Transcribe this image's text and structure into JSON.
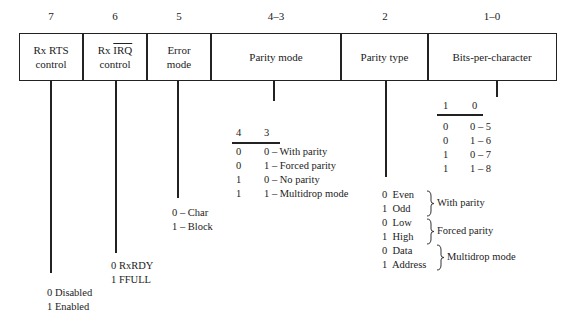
{
  "fields": [
    {
      "bits": "7",
      "label_line1": "Rx  RTS",
      "label_line2": "control"
    },
    {
      "bits": "6",
      "label_prefix": "Rx ",
      "label_overline": "IRQ",
      "label_line2": "control"
    },
    {
      "bits": "5",
      "label_line1": "Error",
      "label_line2": "mode"
    },
    {
      "bits": "4–3",
      "label_line1": "Parity mode"
    },
    {
      "bits": "2",
      "label_line1": "Parity type"
    },
    {
      "bits": "1–0",
      "label_line1": "Bits-per-character"
    }
  ],
  "rx_rts": {
    "line1": "0 Disabled",
    "line2": "1 Enabled"
  },
  "rx_irq": {
    "line1": "0 RxRDY",
    "line2": "1 FFULL"
  },
  "error_mode": {
    "line1": "0 – Char",
    "line2": "1 – Block"
  },
  "parity_mode": {
    "headers": [
      "4",
      "3"
    ],
    "rows": [
      {
        "b4": "0",
        "b3": "0 – With parity"
      },
      {
        "b4": "0",
        "b3": "1 – Forced parity"
      },
      {
        "b4": "1",
        "b3": "0 – No parity"
      },
      {
        "b4": "1",
        "b3": "1 – Multidrop mode"
      }
    ]
  },
  "parity_type": {
    "rows": [
      "0  Even",
      "1  Odd",
      "0  Low",
      "1  High",
      "0  Data",
      "1  Address"
    ],
    "groups": [
      "With parity",
      "Forced parity",
      "Multidrop mode"
    ]
  },
  "bits_per_char": {
    "headers": [
      "1",
      "0"
    ],
    "rows": [
      {
        "b1": "0",
        "b0": "0 – 5"
      },
      {
        "b1": "0",
        "b0": "1 – 6"
      },
      {
        "b1": "1",
        "b0": "0 – 7"
      },
      {
        "b1": "1",
        "b0": "1 – 8"
      }
    ]
  }
}
